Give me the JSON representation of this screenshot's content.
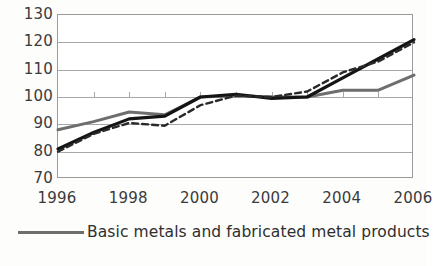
{
  "chart_data": {
    "type": "line",
    "title": "",
    "xlabel": "",
    "ylabel": "",
    "xlim": [
      1996,
      2006
    ],
    "ylim": [
      70,
      130
    ],
    "yticks": [
      70,
      80,
      90,
      100,
      110,
      120,
      130
    ],
    "xticks": [
      1996,
      1997,
      1998,
      1999,
      2000,
      2001,
      2002,
      2003,
      2004,
      2005,
      2006
    ],
    "xtick_labels": [
      "1996",
      "",
      "1998",
      "",
      "2000",
      "",
      "2002",
      "",
      "2004",
      "",
      "2006"
    ],
    "grid": true,
    "legend_position": "below",
    "x": [
      1996,
      1997,
      1998,
      1999,
      2000,
      2001,
      2002,
      2003,
      2004,
      2005,
      2006
    ],
    "series": [
      {
        "name": "Basic metals and fabricated metal products",
        "style": "solid",
        "color": "#6e6e6e",
        "width": 3,
        "values": [
          88,
          91,
          94.5,
          93.5,
          100,
          100.5,
          100,
          100,
          102.5,
          102.5,
          108
        ]
      },
      {
        "name": "Series 2",
        "style": "solid",
        "color": "#141414",
        "width": 3.2,
        "values": [
          81,
          87,
          92,
          93,
          100,
          101,
          99.5,
          100,
          107,
          114,
          121
        ]
      },
      {
        "name": "Series 3",
        "style": "dashed",
        "color": "#2a2a2a",
        "width": 2.4,
        "values": [
          80,
          86.5,
          90.5,
          89.5,
          97,
          100.5,
          100,
          102,
          109,
          113,
          120
        ]
      }
    ]
  },
  "y_axis": {
    "labels": [
      "130",
      "120",
      "110",
      "100",
      "90",
      "80",
      "70"
    ]
  },
  "x_axis": {
    "labels": [
      "1996",
      "1998",
      "2000",
      "2002",
      "2004",
      "2006"
    ],
    "label_years": [
      1996,
      1998,
      2000,
      2002,
      2004,
      2006
    ]
  },
  "legend": {
    "label": "Basic metals and fabricated metal products",
    "swatch_color": "#6e6e6e"
  },
  "colors": {
    "grid": "#a8a8a8",
    "frame": "#9a9a9a",
    "text": "#3b3b3b",
    "background": "#fdfdfc"
  }
}
